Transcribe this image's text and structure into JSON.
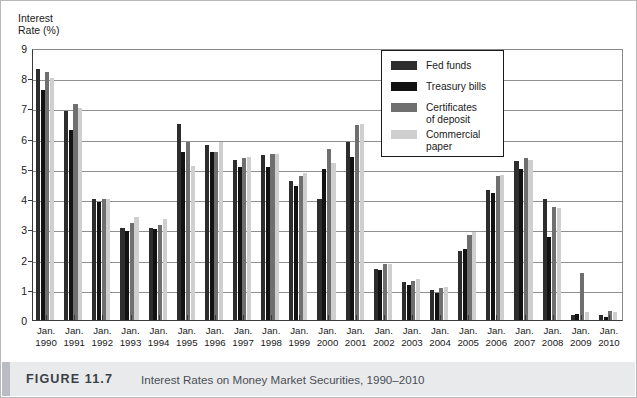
{
  "figure": {
    "label": "FIGURE 11.7",
    "title": "Interest Rates on Money Market Securities, 1990–2010"
  },
  "axis": {
    "y_title": "Interest\nRate (%)",
    "y_ticks": [
      "0",
      "1",
      "2",
      "3",
      "4",
      "5",
      "6",
      "7",
      "8",
      "9"
    ]
  },
  "legend": {
    "items": [
      {
        "label": "Fed funds",
        "color": "#2d2d2d"
      },
      {
        "label": "Treasury bills",
        "color": "#121212"
      },
      {
        "label": "Certificates\nof deposit",
        "color": "#6f6f6f"
      },
      {
        "label": "Commercial\npaper",
        "color": "#cfcfcf"
      }
    ]
  },
  "chart_data": {
    "type": "bar",
    "title": "Interest Rates on Money Market Securities, 1990–2010",
    "xlabel": "",
    "ylabel": "Interest Rate (%)",
    "ylim": [
      0,
      9
    ],
    "ytick_step": 1,
    "grid": true,
    "legend_position": "inside-top-right",
    "x_prefix": "Jan.",
    "categories": [
      "Jan. 1990",
      "Jan. 1991",
      "Jan. 1992",
      "Jan. 1993",
      "Jan. 1994",
      "Jan. 1995",
      "Jan. 1996",
      "Jan. 1997",
      "Jan. 1998",
      "Jan. 1999",
      "Jan. 2000",
      "Jan. 2001",
      "Jan. 2002",
      "Jan. 2003",
      "Jan. 2004",
      "Jan. 2005",
      "Jan. 2006",
      "Jan. 2007",
      "Jan. 2008",
      "Jan. 2009",
      "Jan. 2010"
    ],
    "category_years": [
      "1990",
      "1991",
      "1992",
      "1993",
      "1994",
      "1995",
      "1996",
      "1997",
      "1998",
      "1999",
      "2000",
      "2001",
      "2002",
      "2003",
      "2004",
      "2005",
      "2006",
      "2007",
      "2008",
      "2009",
      "2010"
    ],
    "series": [
      {
        "name": "Fed funds",
        "color": "#2d2d2d",
        "values": [
          8.3,
          6.9,
          4.0,
          3.05,
          3.05,
          6.5,
          5.8,
          5.3,
          5.45,
          4.6,
          4.0,
          5.9,
          1.7,
          1.25,
          1.0,
          2.3,
          4.3,
          5.25,
          4.0,
          0.15,
          0.15
        ]
      },
      {
        "name": "Treasury bills",
        "color": "#121212",
        "values": [
          7.6,
          6.3,
          3.9,
          2.95,
          3.0,
          5.55,
          5.55,
          5.05,
          5.05,
          4.45,
          5.0,
          5.4,
          1.65,
          1.15,
          0.9,
          2.35,
          4.2,
          5.0,
          2.75,
          0.2,
          0.1
        ]
      },
      {
        "name": "Certificates of deposit",
        "color": "#6f6f6f",
        "values": [
          8.2,
          7.15,
          4.0,
          3.2,
          3.15,
          5.9,
          5.55,
          5.35,
          5.5,
          4.75,
          5.65,
          6.45,
          1.85,
          1.3,
          1.05,
          2.8,
          4.75,
          5.35,
          3.75,
          1.55,
          0.3
        ]
      },
      {
        "name": "Commercial paper",
        "color": "#cfcfcf",
        "values": [
          8.0,
          7.0,
          4.0,
          3.4,
          3.35,
          5.1,
          5.9,
          5.4,
          5.5,
          4.85,
          5.2,
          6.5,
          1.85,
          1.35,
          1.1,
          2.9,
          4.8,
          5.3,
          3.7,
          0.25,
          0.25
        ]
      }
    ]
  }
}
